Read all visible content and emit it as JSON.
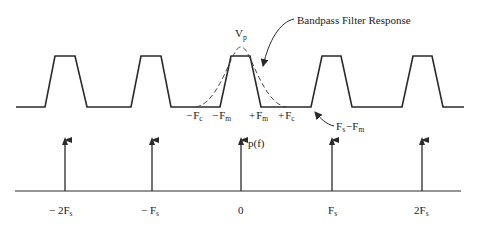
{
  "colors": {
    "line": "#2a2a2a",
    "dashed": "#444444",
    "background": "#ffffff"
  },
  "top_plot": {
    "peak_label": {
      "main": "V",
      "sub": "p"
    },
    "filter_label": "Bandpass Filter Response",
    "freq_labels": [
      {
        "sign": "−",
        "main": "F",
        "sub": "c"
      },
      {
        "sign": "−",
        "main": "F",
        "sub": "m"
      },
      {
        "sign": "+",
        "main": "F",
        "sub": "m"
      },
      {
        "sign": "+",
        "main": "F",
        "sub": "c"
      }
    ],
    "alias_label": {
      "main1": "F",
      "sub1": "s",
      "op": "−",
      "main2": "F",
      "sub2": "m"
    }
  },
  "bottom_plot": {
    "function_label": "p(f)",
    "axis_ticks": [
      {
        "pre": "− 2",
        "main": "F",
        "sub": "s"
      },
      {
        "pre": "− ",
        "main": "F",
        "sub": "s"
      },
      {
        "pre": "",
        "main": "0",
        "sub": ""
      },
      {
        "pre": "",
        "main": "F",
        "sub": "s"
      },
      {
        "pre": "2",
        "main": "F",
        "sub": "s"
      }
    ]
  }
}
